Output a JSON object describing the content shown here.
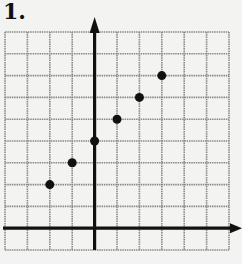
{
  "problem": {
    "label": "1."
  },
  "colors": {
    "grid": "#8a8a8a",
    "axis": "#111111",
    "point": "#111111",
    "background": "#f3f3f1"
  },
  "chart_data": {
    "type": "scatter",
    "title": "1.",
    "xlabel": "",
    "ylabel": "",
    "grid": true,
    "xlim": [
      -4,
      6
    ],
    "ylim": [
      -1,
      9
    ],
    "points": [
      {
        "x": -2,
        "y": 2
      },
      {
        "x": -1,
        "y": 3
      },
      {
        "x": 0,
        "y": 4
      },
      {
        "x": 1,
        "y": 5
      },
      {
        "x": 2,
        "y": 6
      },
      {
        "x": 3,
        "y": 7
      }
    ],
    "tick_labels": false,
    "axes_arrows": [
      "positive-x",
      "positive-y"
    ]
  }
}
